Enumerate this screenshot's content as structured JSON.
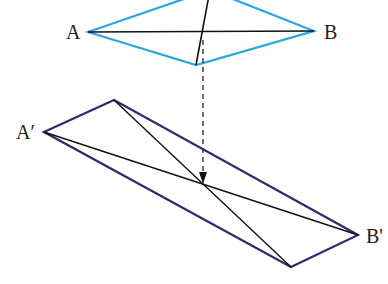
{
  "diagram": {
    "labels": {
      "A": "A",
      "B": "B",
      "A_prime": "A′",
      "B_prime": "B'"
    },
    "colors": {
      "top_shape": "#2aa6e0",
      "bottom_shape": "#2f2b6e",
      "diagonals": "#111111",
      "arrow": "#111111"
    }
  }
}
